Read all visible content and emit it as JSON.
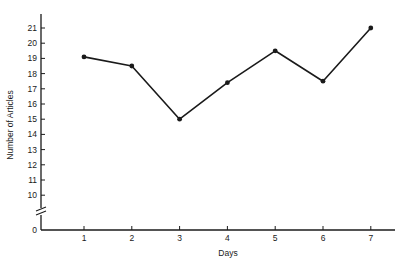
{
  "chart_data": {
    "type": "line",
    "title": "",
    "xlabel": "Days",
    "ylabel": "Number of Articles",
    "x": [
      1,
      2,
      3,
      4,
      5,
      6,
      7
    ],
    "categories": [
      "1",
      "2",
      "3",
      "4",
      "5",
      "6",
      "7"
    ],
    "series": [
      {
        "name": "Number of Articles",
        "values": [
          19.1,
          18.5,
          15.0,
          17.4,
          19.5,
          17.5,
          21.0
        ]
      }
    ],
    "yticks": [
      "0",
      "10",
      "11",
      "12",
      "13",
      "14",
      "15",
      "16",
      "17",
      "18",
      "19",
      "20",
      "21"
    ],
    "ylim": [
      0,
      21.5
    ],
    "axis_break": "between 0 and 10 on y-axis",
    "grid": false,
    "legend": false,
    "markers": true,
    "line_color": "#1a1a1a"
  }
}
